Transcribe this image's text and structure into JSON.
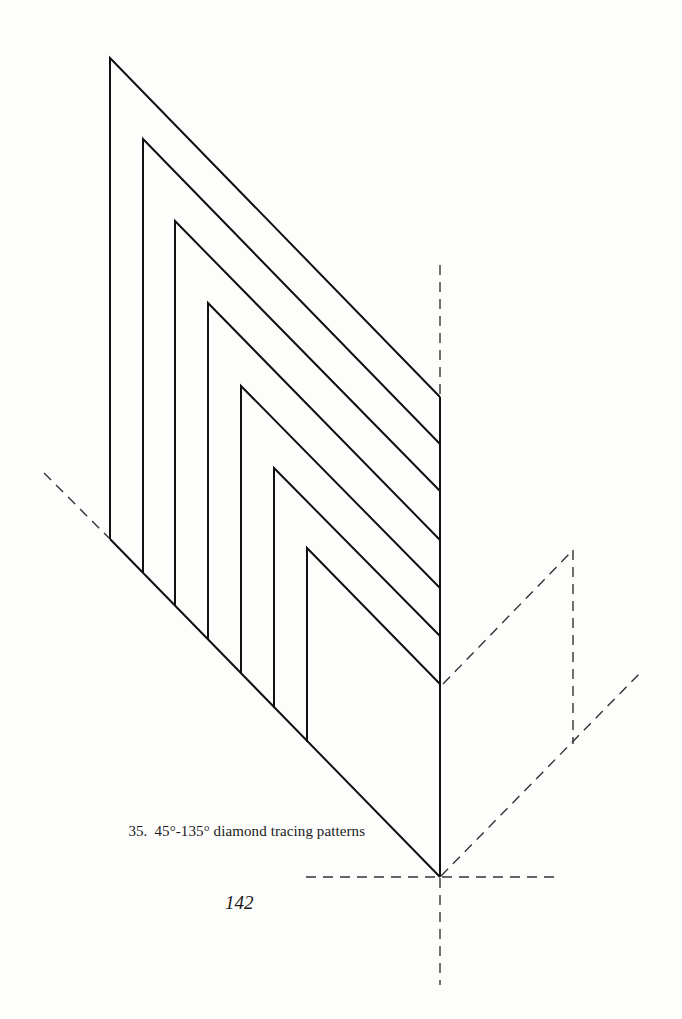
{
  "figure": {
    "number": "35.",
    "caption": "45°-135° diamond tracing patterns",
    "stroke_color": "#111111",
    "dash_color": "#333333",
    "patterns": [
      {
        "id": 1,
        "top_left": [
          110,
          58
        ],
        "right_meet": [
          440,
          397
        ],
        "bottom_left": [
          110,
          539
        ]
      },
      {
        "id": 2,
        "top_left": [
          143,
          139
        ],
        "right_meet": [
          440,
          444
        ],
        "bottom_left": [
          143,
          572
        ]
      },
      {
        "id": 3,
        "top_left": [
          175,
          221
        ],
        "right_meet": [
          440,
          491
        ],
        "bottom_left": [
          175,
          606
        ]
      },
      {
        "id": 4,
        "top_left": [
          208,
          303
        ],
        "right_meet": [
          440,
          540
        ],
        "bottom_left": [
          208,
          640
        ]
      },
      {
        "id": 5,
        "top_left": [
          241,
          386
        ],
        "right_meet": [
          440,
          588
        ],
        "bottom_left": [
          241,
          674
        ]
      },
      {
        "id": 6,
        "top_left": [
          274,
          468
        ],
        "right_meet": [
          440,
          636
        ],
        "bottom_left": [
          274,
          708
        ]
      },
      {
        "id": 7,
        "top_left": [
          307,
          548
        ],
        "right_meet": [
          440,
          684
        ],
        "bottom_left": [
          307,
          742
        ]
      }
    ],
    "shared_edges": {
      "right_vertical": {
        "from": [
          440,
          397
        ],
        "to": [
          440,
          877
        ]
      },
      "bottom_diagonal": {
        "from": [
          110,
          539
        ],
        "to": [
          440,
          877
        ]
      }
    },
    "construction_lines": [
      {
        "name": "top-vertical-dashed",
        "from": [
          440,
          265
        ],
        "to": [
          440,
          396
        ]
      },
      {
        "name": "left-diagonal-dashed",
        "from": [
          44,
          473
        ],
        "to": [
          109,
          538
        ]
      },
      {
        "name": "horizontal-dashed",
        "from": [
          306,
          877
        ],
        "to": [
          558,
          877
        ]
      },
      {
        "name": "bottom-vertical-dashed",
        "from": [
          440,
          878
        ],
        "to": [
          440,
          985
        ]
      },
      {
        "name": "upper-right-diagonal-dashed",
        "from": [
          443,
          684
        ],
        "to": [
          573,
          550
        ]
      },
      {
        "name": "right-vertical-dashed",
        "from": [
          573,
          550
        ],
        "to": [
          573,
          744
        ]
      },
      {
        "name": "lower-right-diagonal-dashed",
        "from": [
          441,
          876
        ],
        "to": [
          643,
          670
        ]
      }
    ]
  },
  "page": {
    "number": "142"
  }
}
